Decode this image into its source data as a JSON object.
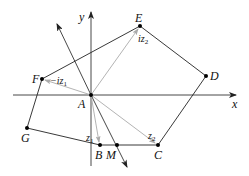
{
  "diagram": {
    "type": "complex-plane-polygon",
    "axes": {
      "x_label": "x",
      "y_label": "y"
    },
    "points": {
      "A": {
        "label": "A",
        "x": 91,
        "y": 95
      },
      "B": {
        "label": "B",
        "x": 100,
        "y": 145
      },
      "C": {
        "label": "C",
        "x": 158,
        "y": 145
      },
      "D": {
        "label": "D",
        "x": 206,
        "y": 76
      },
      "E": {
        "label": "E",
        "x": 140,
        "y": 26
      },
      "F": {
        "label": "F",
        "x": 42,
        "y": 79
      },
      "G": {
        "label": "G",
        "x": 27,
        "y": 128
      },
      "M": {
        "label": "M",
        "x": 117,
        "y": 145
      }
    },
    "vector_labels": {
      "z1": {
        "base": "z",
        "sub": "1",
        "prefix": ""
      },
      "z2": {
        "base": "z",
        "sub": "2",
        "prefix": ""
      },
      "iz1": {
        "base": "iz",
        "sub": "1",
        "prefix": "−"
      },
      "iz2": {
        "base": "iz",
        "sub": "2",
        "prefix": ""
      }
    },
    "colors": {
      "line": "#222222",
      "vector": "#bbbbbb",
      "axis": "#333333",
      "point": "#000000"
    }
  }
}
